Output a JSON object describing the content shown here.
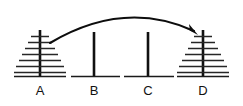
{
  "figure": {
    "background_color": "#ffffff",
    "stroke_color": "#111111",
    "width": 243,
    "height": 106
  },
  "pegs": [
    {
      "id": "A",
      "label": "A",
      "center_x": 40,
      "disk_count": 7,
      "state": "full",
      "base_left": 14,
      "base_right": 66,
      "post_top": 30,
      "post_bottom": 76,
      "disk_widths": [
        18,
        24,
        30,
        36,
        42,
        48,
        52
      ],
      "disk_y": [
        36,
        42,
        48,
        54,
        60,
        66,
        72
      ]
    },
    {
      "id": "B",
      "label": "B",
      "center_x": 94,
      "disk_count": 0,
      "state": "empty",
      "base_left": 71,
      "base_right": 120,
      "post_top": 32,
      "post_bottom": 76,
      "disk_widths": [],
      "disk_y": []
    },
    {
      "id": "C",
      "label": "C",
      "center_x": 148,
      "disk_count": 0,
      "state": "empty",
      "base_left": 124,
      "base_right": 174,
      "post_top": 32,
      "post_bottom": 76,
      "disk_widths": [],
      "disk_y": []
    },
    {
      "id": "D",
      "label": "D",
      "center_x": 203,
      "disk_count": 7,
      "state": "full",
      "base_left": 177,
      "base_right": 229,
      "post_top": 30,
      "post_bottom": 76,
      "disk_widths": [
        18,
        24,
        30,
        36,
        42,
        48,
        52
      ],
      "disk_y": [
        36,
        42,
        48,
        54,
        60,
        66,
        72
      ]
    }
  ],
  "arrow": {
    "name": "move-arrow",
    "from_peg": "A",
    "to_peg": "D",
    "label": "",
    "start_x": 50,
    "start_y": 43,
    "control_x": 124,
    "control_y": 2,
    "end_x": 195,
    "end_y": 33,
    "head_angle_deg": 48,
    "color": "#0d0d0d"
  },
  "labels": {
    "label_y": 95,
    "items": [
      "A",
      "B",
      "C",
      "D"
    ]
  }
}
